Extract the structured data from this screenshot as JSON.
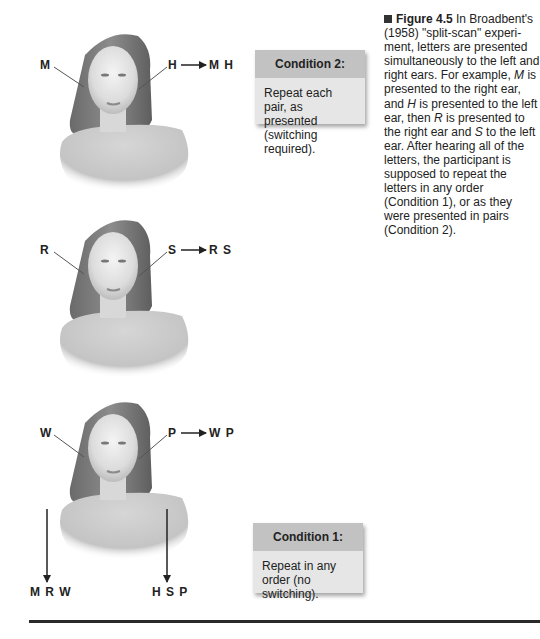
{
  "figure": {
    "number": "Figure 4.5",
    "caption_text": "In Broadbent's (1958) \"split-scan\" experiment, letters are presented simultaneously to the left and right ears. For example, M is presented to the right ear, and H is presented to the left ear, then R is presented to the right ear and S to the left ear. After hearing all of the letters, the participant is supposed to repeat the letters in any order (Condition 1), or as they were presented in pairs (Condition 2).",
    "caption_parts": {
      "p1": " In Broadbent's (1958) \"split-scan\" experi-ment, letters are presented simultaneously to the left and right ears. For example, ",
      "m": "M",
      "p2": " is presented to the right ear, and ",
      "h": "H",
      "p3": " is presented to the left ear, then ",
      "r": "R",
      "p4": " is presented to the right ear and ",
      "s": "S",
      "p5": " to the left ear. After hearing all of the letters, the participant is supposed to repeat the letters in any order (Condition 1), or as they were presented in pairs (Condition 2)."
    }
  },
  "trials": [
    {
      "right_ear": "M",
      "left_ear": "H",
      "pair_output": "M H"
    },
    {
      "right_ear": "R",
      "left_ear": "S",
      "pair_output": "R S"
    },
    {
      "right_ear": "W",
      "left_ear": "P",
      "pair_output": "W P"
    }
  ],
  "ear_outputs": {
    "right_ear_sequence": "M R W",
    "left_ear_sequence": "H S P"
  },
  "conditions": {
    "condition2": {
      "title": "Condition 2:",
      "text": "Repeat each pair, as presented (switching required)."
    },
    "condition1": {
      "title": "Condition 1:",
      "text": "Repeat in any order (no switching)."
    }
  },
  "colors": {
    "box_header": "#c2c2c2",
    "box_body": "#e6e6e6",
    "text": "#222222",
    "rule": "#2a2a2a"
  }
}
